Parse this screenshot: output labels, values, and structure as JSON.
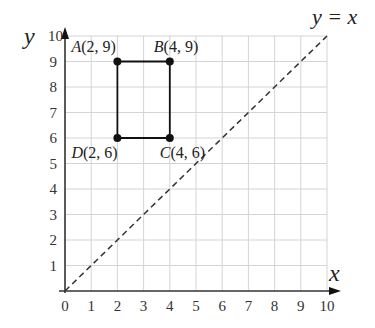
{
  "chart_data": {
    "type": "scatter",
    "title": "",
    "xlabel": "x",
    "ylabel": "y",
    "xlim": [
      0,
      10
    ],
    "ylim": [
      0,
      10
    ],
    "x_ticks": [
      "0",
      "1",
      "2",
      "3",
      "4",
      "5",
      "6",
      "7",
      "8",
      "9",
      "10"
    ],
    "y_ticks": [
      "1",
      "2",
      "3",
      "4",
      "5",
      "6",
      "7",
      "8",
      "9",
      "10"
    ],
    "grid": true,
    "points": [
      {
        "name": "A",
        "x": 2,
        "y": 9,
        "label_name": "A",
        "label_coords": "(2, 9)"
      },
      {
        "name": "B",
        "x": 4,
        "y": 9,
        "label_name": "B",
        "label_coords": "(4, 9)"
      },
      {
        "name": "C",
        "x": 4,
        "y": 6,
        "label_name": "C",
        "label_coords": "(4, 6)"
      },
      {
        "name": "D",
        "x": 2,
        "y": 6,
        "label_name": "D",
        "label_coords": "(2, 6)"
      }
    ],
    "polygon": [
      "A",
      "B",
      "C",
      "D"
    ],
    "line": {
      "equation_label": "y = x",
      "style": "dashed",
      "from": [
        0,
        0
      ],
      "to": [
        10,
        10
      ]
    }
  }
}
